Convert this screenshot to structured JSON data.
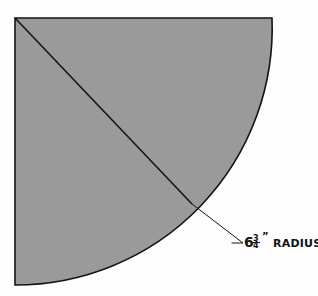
{
  "figure": {
    "kind": "technical-drawing",
    "background_color": "#fefefe"
  },
  "colors": {
    "fill": "#9a9a9a",
    "stroke": "#141414",
    "leader": "#141414",
    "text": "#111111",
    "background": "#fefefe"
  },
  "geometry": {
    "center_x": 15,
    "center_y": 18,
    "radius": 257,
    "top_edge_end_x": 272,
    "top_edge_end_y": 18,
    "left_edge_end_x": 15,
    "left_edge_end_y": 285,
    "arc_sweep_degrees": 90,
    "stroke_width": 1.6,
    "radius_line": {
      "from_x": 15,
      "from_y": 18,
      "to_x": 192,
      "to_y": 204
    },
    "leader": {
      "anchor_x": 192,
      "anchor_y": 204,
      "elbow_x": 243,
      "elbow_y": 243,
      "tick_x": 232,
      "tick_y": 243
    }
  },
  "annotation": {
    "whole_number": "6",
    "fraction_numerator": "3",
    "fraction_denominator": "4",
    "unit_mark": "”",
    "term": "RADIUS",
    "full_text": "6 3/4” RADIUS",
    "x": 244,
    "y": 247,
    "font_size_number": 14,
    "font_size_term": 11,
    "font_size_fraction": 8
  }
}
